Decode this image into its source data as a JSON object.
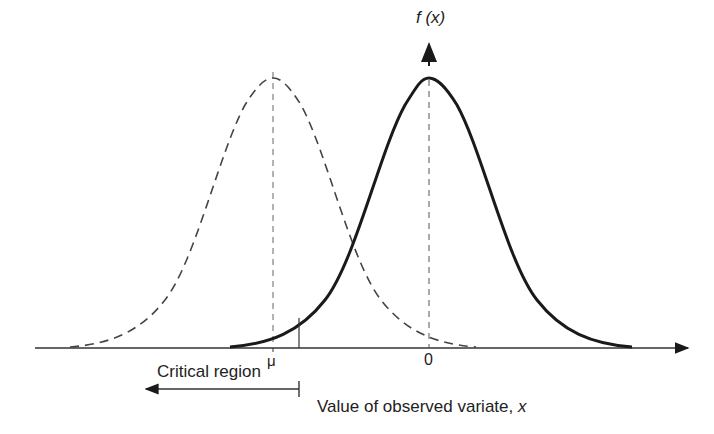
{
  "diagram": {
    "title": "",
    "y_axis_label": "f (x)",
    "x_axis_label": "Value of observed variate, x",
    "x_axis_label_prefix": "Value of observed variate, ",
    "x_axis_label_var": "x",
    "tick_mu": "μ",
    "tick_zero": "0",
    "critical_region_label": "Critical region",
    "curves": [
      {
        "name": "null-distribution",
        "style": "solid",
        "center": "0"
      },
      {
        "name": "alternative-distribution",
        "style": "dashed",
        "center": "μ"
      }
    ],
    "colors": {
      "line": "#1a1a1a",
      "dashed": "#444444",
      "background": "#ffffff"
    }
  }
}
